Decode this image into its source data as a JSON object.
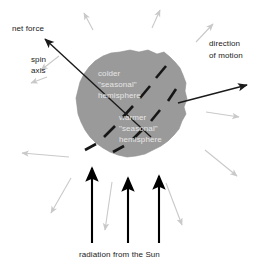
{
  "figure": {
    "type": "diagram",
    "background_color": "#ffffff",
    "body": {
      "name": "asteroid",
      "fill_color": "#9a9a9a",
      "label_color": "#e6e6e6",
      "terminator_style": "dashed",
      "terminator_color": "#161616"
    },
    "labels": {
      "net_force": "net force",
      "spin_axis_line1": "spin",
      "spin_axis_line2": "axis",
      "direction_line1": "direction",
      "direction_line2": "of motion",
      "colder_line1": "colder",
      "colder_line2": "\"seasonal\"",
      "colder_line3": "hemisphere",
      "warmer_line1": "warmer",
      "warmer_line2": "\"seasonal\"",
      "warmer_line3": "hemisphere",
      "solar_radiation": "radiation from the Sun"
    },
    "arrows": {
      "net_force_color": "#1a1a1a",
      "direction_color": "#1a1a1a",
      "solar_color": "#000000",
      "thermal_color": "#c9c9c9",
      "solar_count": 3,
      "thermal_count": 10
    }
  }
}
